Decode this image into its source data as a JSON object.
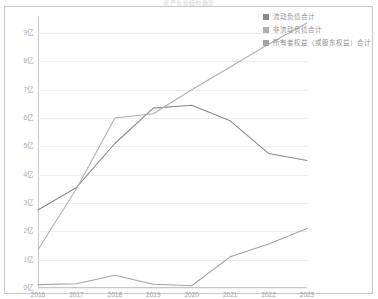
{
  "title_strip": "资产负债结构趋势",
  "chart_data": {
    "type": "line",
    "title": "资产负债结构趋势",
    "xlabel": "",
    "ylabel": "",
    "categories": [
      "2016",
      "2017",
      "2018",
      "2019",
      "2020",
      "2021",
      "2022",
      "2023"
    ],
    "x": [
      2016,
      2017,
      2018,
      2019,
      2020,
      2021,
      2022,
      2023
    ],
    "ylim": [
      0,
      9.6
    ],
    "yticks": [
      0,
      1,
      2,
      3,
      4,
      5,
      6,
      7,
      8,
      9
    ],
    "ytick_labels": [
      "0亿",
      "1亿",
      "2亿",
      "3亿",
      "4亿",
      "5亿",
      "6亿",
      "7亿",
      "8亿",
      "9亿"
    ],
    "y_unit": "亿",
    "grid": true,
    "legend_position": "top-right",
    "series": [
      {
        "name": "流动负债合计",
        "color": "#8a8a8a",
        "values": [
          2.75,
          3.55,
          5.1,
          6.35,
          6.45,
          5.9,
          4.75,
          4.5
        ]
      },
      {
        "name": "非流动负债合计",
        "color": "#b0b0b0",
        "values": [
          1.35,
          3.5,
          6.0,
          6.15,
          7.0,
          7.8,
          8.6,
          9.35
        ]
      },
      {
        "name": "所有者权益（或股东权益）合计",
        "color": "#a3a3a3",
        "values": [
          0.12,
          0.15,
          0.45,
          0.13,
          0.08,
          1.1,
          1.55,
          2.1
        ]
      }
    ]
  },
  "legend": {
    "items": [
      {
        "label": "流动负债合计",
        "color": "#8a8a8a"
      },
      {
        "label": "非流动负债合计",
        "color": "#b0b0b0"
      },
      {
        "label": "所有者权益（或股东权益）合计",
        "color": "#a3a3a3"
      }
    ]
  }
}
